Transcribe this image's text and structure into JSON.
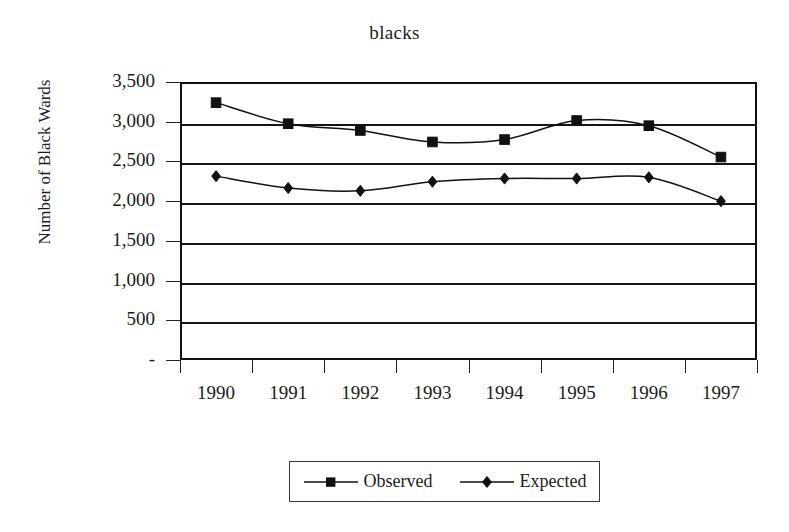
{
  "chart_data": {
    "type": "line",
    "title": "blacks",
    "xlabel": "",
    "ylabel": "Number of Black Wards",
    "categories": [
      "1990",
      "1991",
      "1992",
      "1993",
      "1994",
      "1995",
      "1996",
      "1997"
    ],
    "series": [
      {
        "name": "Observed",
        "marker": "square",
        "color": "#111111",
        "values": [
          3240,
          2975,
          2890,
          2745,
          2775,
          3015,
          2950,
          2555
        ]
      },
      {
        "name": "Expected",
        "marker": "diamond",
        "color": "#111111",
        "values": [
          2315,
          2165,
          2130,
          2245,
          2285,
          2285,
          2300,
          2000
        ]
      }
    ],
    "ylim": [
      0,
      3500
    ],
    "ytick_values": [
      3500,
      3000,
      2500,
      2000,
      1500,
      1000,
      500,
      0
    ],
    "ytick_labels": [
      "3,500",
      "3,000",
      "2,500",
      "2,000",
      "1,500",
      "1,000",
      "500",
      "-"
    ],
    "grid": true,
    "legend_position": "bottom"
  },
  "legend": {
    "entries": [
      {
        "label": "Observed",
        "marker": "square"
      },
      {
        "label": "Expected",
        "marker": "diamond"
      }
    ]
  }
}
